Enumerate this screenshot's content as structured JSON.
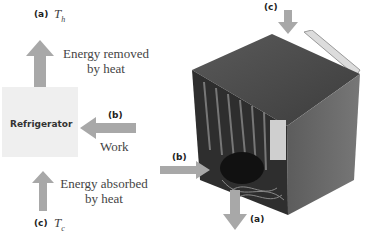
{
  "diagram": {
    "top_label": {
      "tag": "(a)",
      "symbol": "T",
      "subscript": "h"
    },
    "top_text": [
      "Energy removed",
      "by heat"
    ],
    "box_label": "Refrigerator",
    "work_tag": "(b)",
    "work_text": "Work",
    "bottom_text": [
      "Energy absorbed",
      "by heat"
    ],
    "bottom_label": {
      "tag": "(c)",
      "symbol": "T",
      "subscript": "c"
    }
  },
  "photo": {
    "label_c": "(c)",
    "label_b": "(b)",
    "label_a": "(a)"
  },
  "colors": {
    "arrow": "#a8a8a8",
    "box": "#efefef",
    "fridge_body": "#4a4a4a",
    "text": "#444444"
  }
}
